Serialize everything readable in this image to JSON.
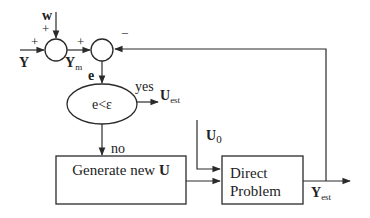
{
  "diagram": {
    "type": "block-diagram",
    "inputs": {
      "y_label": "Y",
      "w_label": "w",
      "ym_label": "Y",
      "ym_sub": "m",
      "e_label": "e",
      "u0_label": "U",
      "u0_sub": "0"
    },
    "signs": {
      "sum1_left": "+",
      "sum1_top": "+",
      "sum2_left": "+",
      "sum2_right": "−"
    },
    "decision": {
      "condition": "e<ε",
      "yes_label": "yes",
      "no_label": "no",
      "output_label": "U",
      "output_sub": "est"
    },
    "blocks": {
      "generate": {
        "text": "Generate new ",
        "bold_suffix": "U"
      },
      "direct": {
        "line1": "Direct",
        "line2": "Problem"
      }
    },
    "output": {
      "label": "Y",
      "sub": "est"
    },
    "colors": {
      "line": "#2a2a2a",
      "text": "#222222",
      "background": "#ffffff"
    }
  }
}
